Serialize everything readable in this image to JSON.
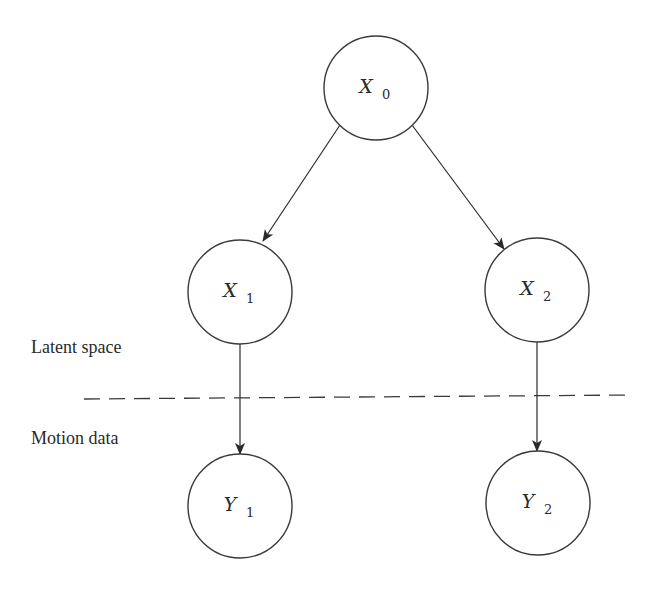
{
  "diagram": {
    "type": "graphical-model",
    "nodes": [
      {
        "id": "X0",
        "var": "X",
        "sub": "0",
        "cx": 376,
        "cy": 88,
        "r": 52
      },
      {
        "id": "X1",
        "var": "X",
        "sub": "1",
        "cx": 240,
        "cy": 292,
        "r": 52
      },
      {
        "id": "X2",
        "var": "X",
        "sub": "2",
        "cx": 537,
        "cy": 290,
        "r": 52
      },
      {
        "id": "Y1",
        "var": "Y",
        "sub": "1",
        "cx": 240,
        "cy": 506,
        "r": 52
      },
      {
        "id": "Y2",
        "var": "Y",
        "sub": "2",
        "cx": 538,
        "cy": 503,
        "r": 52
      }
    ],
    "edges": [
      {
        "from": "X0",
        "to": "X1"
      },
      {
        "from": "X0",
        "to": "X2"
      },
      {
        "from": "X1",
        "to": "Y1"
      },
      {
        "from": "X2",
        "to": "Y2"
      }
    ],
    "regions": {
      "upper_label": "Latent space",
      "lower_label": "Motion data"
    },
    "colors": {
      "stroke": "#3a3a3a",
      "text": "#2a2a2a",
      "background": "#ffffff"
    }
  }
}
